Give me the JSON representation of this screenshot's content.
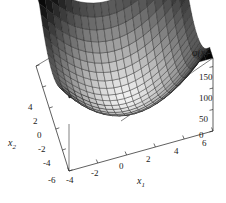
{
  "chart_data": {
    "type": "surface",
    "title": "",
    "xlabel": "x_1",
    "ylabel": "x_2",
    "zlabel": "phi(x)",
    "zlabel_display": "φ(x)",
    "xlim": [
      -4,
      6
    ],
    "ylim": [
      -6,
      4
    ],
    "zlim": [
      0,
      170
    ],
    "grid": false,
    "legend": "none",
    "colormap": "grayscale",
    "shading": "height-mapped gray, dark = high, light = low",
    "mesh": {
      "nx": 20,
      "ny": 20,
      "line_color": "#1a1a1a"
    },
    "function": "quadratic bowl / paraboloid: phi(x) = a*(x1-c1)^2 + b*(x2-c2)^2",
    "surface_params": {
      "a": 4.2,
      "b": 4.2,
      "c1": 1.0,
      "c2": -1.0,
      "zmax": 170
    },
    "xticks": [
      -4,
      -2,
      0,
      2,
      4,
      6
    ],
    "xticklabels": [
      "-4",
      "-2",
      "0",
      "2",
      "4",
      "6"
    ],
    "yticks": [
      4,
      2,
      0,
      -2,
      -4,
      -6
    ],
    "yticklabels": [
      "4",
      "2",
      "0",
      "-2",
      "-4",
      "-6"
    ],
    "zticks": [
      0,
      50,
      100,
      150
    ],
    "zticklabels": [
      "0",
      "50",
      "100",
      "150"
    ],
    "view": {
      "azimuth": -50,
      "elevation": 22
    },
    "box": true,
    "background": "#ffffff"
  },
  "axes": {
    "x1": {
      "name": "x",
      "sub": "1"
    },
    "x2": {
      "name": "x",
      "sub": "2"
    },
    "z": {
      "label": "φ(x)"
    }
  },
  "ticklabels": {
    "z0": "0",
    "z50": "50",
    "z100": "100",
    "z150": "150",
    "y4": "4",
    "y2": "2",
    "y0": "0",
    "ym2": "-2",
    "ym4": "-4",
    "ym6": "-6",
    "xm4": "-4",
    "xm2": "-2",
    "x0": "0",
    "x2": "2",
    "x4": "4",
    "x6": "6"
  },
  "colors": {
    "background": "#ffffff",
    "mesh_line": "#1a1a1a",
    "box_line": "#2b2b2b",
    "axis_line": "#2b2b2b",
    "text": "#151515",
    "surface_high": "#050505",
    "surface_low": "#f0f0f0"
  }
}
